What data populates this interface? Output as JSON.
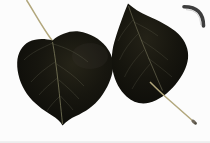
{
  "image": {
    "type": "photograph",
    "description": "Two dark poplar leaves with long slender stalks on a white background, framed by a dark rounded border along the top and right edges",
    "objects": {
      "frame": "rounded top-right border frame",
      "left_leaf": "heart-shaped dark leaf with stalk curving up to the top edge",
      "right_leaf": "rounded triangular dark leaf, tip pointing up, stalk extending to the lower right with a club-shaped end"
    },
    "colors": {
      "background": "#fcfcfc",
      "leaf_dark": "#14130e",
      "frame_gray": "#454545",
      "stalk_tan": "#b2a77c",
      "bottom_edge": "#ededed"
    }
  }
}
